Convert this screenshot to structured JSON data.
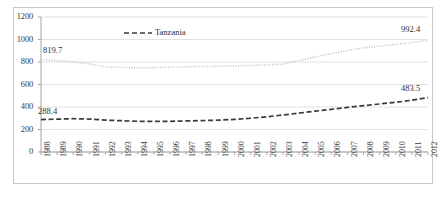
{
  "chart_data": {
    "type": "line",
    "title": "",
    "subtitle": "",
    "xlabel": "",
    "ylabel": "",
    "ylim": [
      0,
      1200
    ],
    "ytick_step": 200,
    "yticks": [
      "0",
      "200",
      "400",
      "600",
      "800",
      "1000",
      "1200"
    ],
    "grid": true,
    "grid_axis": "y",
    "legend_position": "top-left-inside",
    "x": [
      "1988",
      "1989",
      "1990",
      "1991",
      "1992",
      "1993",
      "1994",
      "1995",
      "1996",
      "1997",
      "1998",
      "1999",
      "2000",
      "2001",
      "2002",
      "2003",
      "2004",
      "2005",
      "2006",
      "2007",
      "2008",
      "2009",
      "2010",
      "2011",
      "2012"
    ],
    "categories": [
      "1988",
      "1989",
      "1990",
      "1991",
      "1992",
      "1993",
      "1994",
      "1995",
      "1996",
      "1997",
      "1998",
      "1999",
      "2000",
      "2001",
      "2002",
      "2003",
      "2004",
      "2005",
      "2006",
      "2007",
      "2008",
      "2009",
      "2010",
      "2011",
      "2012"
    ],
    "series": [
      {
        "name": "upper-dotted-series",
        "style": "dotted",
        "color": "#bfbfbf",
        "values": [
          819.7,
          812.0,
          801.0,
          783.0,
          757.0,
          752.0,
          748.0,
          750.0,
          754.0,
          757.0,
          760.0,
          762.0,
          765.0,
          770.0,
          774.0,
          781.0,
          812.0,
          845.0,
          876.0,
          902.0,
          925.0,
          941.0,
          957.0,
          972.0,
          992.4
        ]
      },
      {
        "name": "Tanzania",
        "style": "dashed",
        "color": "#3a3a3a",
        "values": [
          288.4,
          292.0,
          296.0,
          293.0,
          283.0,
          278.0,
          273.0,
          272.0,
          273.0,
          276.0,
          279.0,
          283.0,
          290.0,
          300.0,
          313.0,
          329.0,
          346.0,
          363.0,
          379.0,
          396.0,
          412.0,
          427.0,
          442.0,
          460.0,
          483.5
        ]
      }
    ],
    "annotations": [
      {
        "name": "upper-start-label",
        "text": "819.7",
        "x": "1988",
        "value": 819.7
      },
      {
        "name": "upper-end-label",
        "text": "992.4",
        "x": "2012",
        "value": 992.4
      },
      {
        "name": "lower-start-label",
        "text": "288.4",
        "x": "1988",
        "value": 288.4
      },
      {
        "name": "lower-end-label",
        "text": "483.5",
        "x": "2012",
        "value": 483.5
      }
    ],
    "legend": [
      {
        "name": "Tanzania",
        "style": "dashed",
        "color": "#3a3a3a"
      }
    ]
  },
  "legend": {
    "tanzania_label": "Tanzania"
  },
  "labels": {
    "upper_start": "819.7",
    "upper_end": "992.4",
    "lower_start": "288.4",
    "lower_end": "483.5"
  },
  "colors": {
    "frame": "#c8c8c8",
    "gridline": "#d9d9d9",
    "axis": "#9a9a9a",
    "dotted_series": "#bfbfbf",
    "dashed_series": "#3a3a3a",
    "text": "#3a3a3a"
  }
}
